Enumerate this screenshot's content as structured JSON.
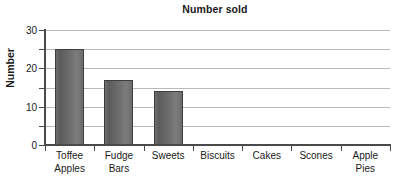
{
  "chart_data": {
    "type": "bar",
    "title": "Number sold",
    "xlabel": "",
    "ylabel": "Number",
    "categories": [
      "Toffee Apples",
      "Fudge Bars",
      "Sweets",
      "Biscuits",
      "Cakes",
      "Scones",
      "Apple Pies"
    ],
    "category_lines": [
      [
        "Toffee",
        "Apples"
      ],
      [
        "Fudge",
        "Bars"
      ],
      [
        "Sweets"
      ],
      [
        "Biscuits"
      ],
      [
        "Cakes"
      ],
      [
        "Scones"
      ],
      [
        "Apple",
        "Pies"
      ]
    ],
    "values": [
      25,
      17,
      14,
      0,
      0,
      0,
      0
    ],
    "ylim": [
      0,
      30
    ],
    "ytick_labels": [
      "0",
      "10",
      "20",
      "30"
    ],
    "ytick_values": [
      0,
      10,
      20,
      30
    ],
    "gridline_values": [
      0,
      5,
      10,
      15,
      20,
      25,
      30
    ],
    "grid": true,
    "legend": "none",
    "bar_color": "#6a6a6a",
    "bar_border_color": "#3d3d3d",
    "axis_color": "#4a4a4a",
    "gridline_color": "#b9b9b9",
    "text_color": "#1a1a1a",
    "background_color": "#ffffff"
  }
}
